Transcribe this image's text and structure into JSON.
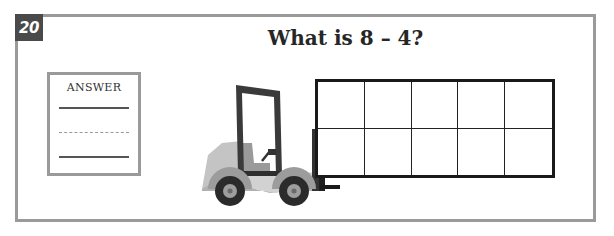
{
  "question": {
    "number": "20",
    "title": "What is 8 – 4?"
  },
  "answer_box": {
    "label": "ANSWER",
    "value": ""
  },
  "ten_frame": {
    "rows": 2,
    "columns": 5,
    "filled_cells": 0
  },
  "illustration": {
    "name": "forklift",
    "colors": {
      "body_light": "#c8c8c8",
      "body_mid": "#a9a9a9",
      "frame_dark": "#3a3a3a",
      "tire": "#2b2b2b",
      "hub": "#9e9e9e"
    }
  },
  "colors": {
    "frame_border": "#9a9a9a",
    "badge_bg": "#4a4a4a",
    "title_text": "#262626",
    "grid_line": "#1a1a1a"
  }
}
